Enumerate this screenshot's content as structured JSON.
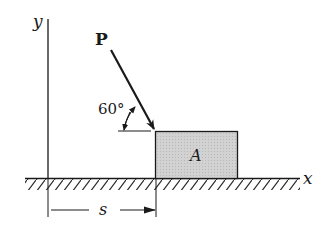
{
  "diagram": {
    "axes": {
      "x_label": "x",
      "y_label": "y"
    },
    "force": {
      "label": "P",
      "angle_label": "60°",
      "angle_degrees": 60,
      "direction": "down-right toward block top-left corner"
    },
    "block": {
      "label": "A",
      "fill_color": "#cfcfcf"
    },
    "dimension": {
      "label": "s",
      "description": "distance from y-axis to block left edge"
    },
    "ground": {
      "style": "hatched"
    },
    "colors": {
      "line": "#1a1a1a",
      "background": "#ffffff"
    }
  }
}
